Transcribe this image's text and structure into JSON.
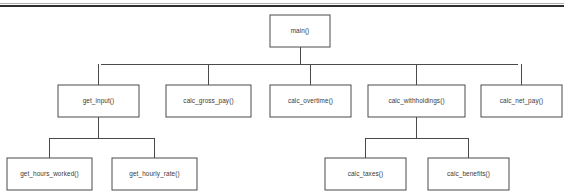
{
  "diagram": {
    "type": "structure-chart",
    "background_color": "#ffffff",
    "box_fill": "#ffffff",
    "box_border_color": "#4a4a4a",
    "connector_color": "#4a4a4a",
    "text_color": "#3a3a3a",
    "header_rule": {
      "color": "#2e2e2e",
      "y": 6,
      "x1": 0,
      "x2": 564
    },
    "nodes": [
      {
        "id": "main",
        "label": "main()",
        "level": 0,
        "x": 270,
        "y": 15,
        "w": 60,
        "h": 32
      },
      {
        "id": "get_input",
        "label": "get_input()",
        "level": 1,
        "x": 58,
        "y": 85,
        "w": 81,
        "h": 32
      },
      {
        "id": "calc_gross_pay",
        "label": "calc_gross_pay()",
        "level": 1,
        "x": 166,
        "y": 85,
        "w": 85,
        "h": 32
      },
      {
        "id": "calc_overtime",
        "label": "calc_overtime()",
        "level": 1,
        "x": 270,
        "y": 85,
        "w": 81,
        "h": 32
      },
      {
        "id": "calc_withholdings",
        "label": "calc_withholdings()",
        "level": 1,
        "x": 368,
        "y": 85,
        "w": 97,
        "h": 32
      },
      {
        "id": "calc_net_pay",
        "label": "calc_net_pay()",
        "level": 1,
        "x": 481,
        "y": 85,
        "w": 81,
        "h": 32
      },
      {
        "id": "get_hours_worked",
        "label": "get_hours_worked()",
        "level": 2,
        "x": 7,
        "y": 158,
        "w": 85,
        "h": 32
      },
      {
        "id": "get_hourly_rate",
        "label": "get_hourly_rate()",
        "level": 2,
        "x": 112,
        "y": 158,
        "w": 85,
        "h": 32
      },
      {
        "id": "calc_taxes",
        "label": "calc_taxes()",
        "level": 2,
        "x": 325,
        "y": 158,
        "w": 81,
        "h": 32
      },
      {
        "id": "calc_benefits",
        "label": "calc_benefits()",
        "level": 2,
        "x": 428,
        "y": 158,
        "w": 81,
        "h": 32
      }
    ],
    "edges": [
      {
        "from": "main",
        "to": "get_input"
      },
      {
        "from": "main",
        "to": "calc_gross_pay"
      },
      {
        "from": "main",
        "to": "calc_overtime"
      },
      {
        "from": "main",
        "to": "calc_withholdings"
      },
      {
        "from": "main",
        "to": "calc_net_pay"
      },
      {
        "from": "get_input",
        "to": "get_hours_worked"
      },
      {
        "from": "get_input",
        "to": "get_hourly_rate"
      },
      {
        "from": "calc_withholdings",
        "to": "calc_taxes"
      },
      {
        "from": "calc_withholdings",
        "to": "calc_benefits"
      }
    ],
    "bus_lines": [
      {
        "id": "main-bus",
        "parent": "main",
        "y": 64,
        "x1": 101,
        "x2": 518
      },
      {
        "id": "get_input-bus",
        "parent": "get_input",
        "y": 138,
        "x1": 49,
        "x2": 154
      },
      {
        "id": "calc-withholdings-bus",
        "parent": "calc_withholdings",
        "y": 138,
        "x1": 365,
        "x2": 468
      }
    ]
  }
}
